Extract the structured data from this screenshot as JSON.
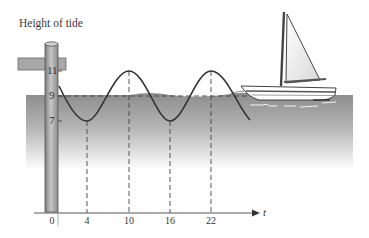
{
  "diagram": {
    "title": "Height of tide",
    "y_axis": {
      "ticks": [
        {
          "label": "11",
          "value": 11
        },
        {
          "label": "9",
          "value": 9
        },
        {
          "label": "7",
          "value": 7
        }
      ]
    },
    "x_axis": {
      "variable": "t",
      "ticks": [
        {
          "label": "0",
          "value": 0
        },
        {
          "label": "4",
          "value": 4
        },
        {
          "label": "10",
          "value": 10
        },
        {
          "label": "16",
          "value": 16
        },
        {
          "label": "22",
          "value": 22
        }
      ]
    },
    "curve": {
      "type": "sinusoid",
      "midline": 9,
      "amplitude": 2,
      "period": 12,
      "minima_t": [
        4,
        16
      ],
      "maxima_t": [
        10,
        22
      ]
    },
    "illustration": {
      "objects": [
        "tide-pole",
        "dock-crossbar",
        "water",
        "sailboat"
      ]
    },
    "colors": {
      "water_top": "#8f8f8f",
      "water_fade": "#ffffff",
      "curve": "#3a3a3a",
      "pole": "#9a9a9a"
    }
  }
}
